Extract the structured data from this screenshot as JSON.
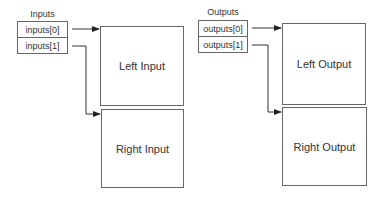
{
  "inputs": {
    "title": "Inputs",
    "items": [
      "inputs[0]",
      "inputs[1]"
    ],
    "targets": [
      "Left Input",
      "Right Input"
    ]
  },
  "outputs": {
    "title": "Outputs",
    "items": [
      "outputs[0]",
      "outputs[1]"
    ],
    "targets": [
      "Left Output",
      "Right Output"
    ]
  },
  "colors": {
    "stroke": "#666666",
    "text": "#333333",
    "background": "#ffffff"
  }
}
